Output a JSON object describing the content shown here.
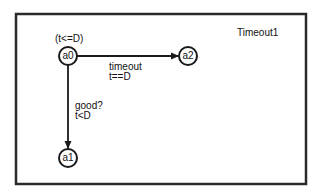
{
  "diagram": {
    "title": "Timeout1",
    "type": "timed-automaton",
    "colors": {
      "stroke": "#1a1a1a",
      "background": "#ffffff",
      "text": "#111111"
    },
    "nodes": [
      {
        "id": "a0",
        "label": "a0",
        "invariant": "(t<=D)",
        "initial": true
      },
      {
        "id": "a2",
        "label": "a2"
      },
      {
        "id": "a1",
        "label": "a1"
      }
    ],
    "edges": [
      {
        "from": "a0",
        "to": "a2",
        "label": "timeout",
        "guard": "t==D"
      },
      {
        "from": "a0",
        "to": "a1",
        "label": "good?",
        "guard": "t<D"
      }
    ]
  }
}
